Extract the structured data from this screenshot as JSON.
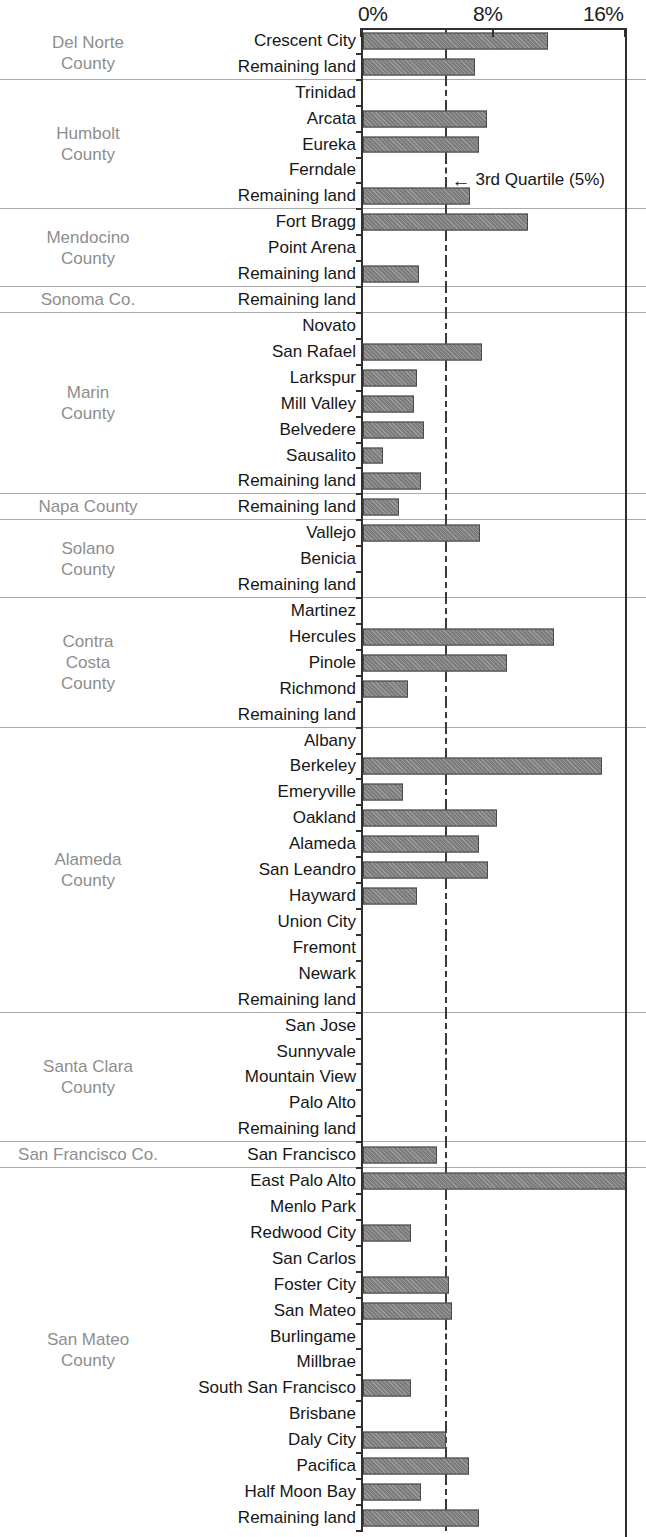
{
  "axis": {
    "ticks": [
      {
        "label": "0%",
        "value": 0
      },
      {
        "label": "8%",
        "value": 8
      },
      {
        "label": "16%",
        "value": 16
      }
    ],
    "min": 0,
    "max": 16,
    "unit": "%"
  },
  "annotation": {
    "arrow": "←",
    "text": "3rd Quartile (5%)",
    "value": 5
  },
  "quartile_line": {
    "value": 5,
    "style": "dashed"
  },
  "colors": {
    "bar_fill": "#7d7d7d",
    "bar_border": "#4a4a4a",
    "axis": "#303030",
    "county_label": "#8e8e8e",
    "row_label": "#161616",
    "separator": "#a9a9a9"
  },
  "chart_data": {
    "type": "bar",
    "orientation": "horizontal",
    "title": "",
    "xlabel": "",
    "ylabel": "",
    "xlim": [
      0,
      16
    ],
    "xticks": [
      0,
      8,
      16
    ],
    "xtick_labels": [
      "0%",
      "8%",
      "16%"
    ],
    "grid": false,
    "legend": null,
    "annotations": [
      {
        "text": "3rd Quartile (5%)",
        "x": 5,
        "category": "Ferndale",
        "marker": "left-arrow"
      }
    ],
    "reference_lines": [
      {
        "label": "3rd Quartile",
        "value": 5,
        "style": "dashed"
      }
    ],
    "groups": [
      {
        "county": "Del Norte\nCounty",
        "county_lines": [
          "Del Norte",
          "County"
        ],
        "categories": [
          "Crescent City",
          "Remaining land"
        ],
        "values": [
          11.2,
          6.8
        ]
      },
      {
        "county": "Humbolt County",
        "county_lines": [
          "Humbolt",
          "County"
        ],
        "categories": [
          "Trinidad",
          "Arcata",
          "Eureka",
          "Ferndale",
          "Remaining land"
        ],
        "values": [
          0,
          7.5,
          7.0,
          0,
          6.5
        ]
      },
      {
        "county": "Mendocino County",
        "county_lines": [
          "Mendocino",
          "County"
        ],
        "categories": [
          "Fort Bragg",
          "Point Arena",
          "Remaining land"
        ],
        "values": [
          10.0,
          0,
          3.4
        ]
      },
      {
        "county": "Sonoma Co.",
        "county_lines": [
          "Sonoma Co."
        ],
        "categories": [
          "Remaining land"
        ],
        "values": [
          0
        ]
      },
      {
        "county": "Marin County",
        "county_lines": [
          "Marin",
          "County"
        ],
        "categories": [
          "Novato",
          "San Rafael",
          "Larkspur",
          "Mill Valley",
          "Belvedere",
          "Sausalito",
          "Remaining land"
        ],
        "values": [
          0,
          7.2,
          3.3,
          3.1,
          3.7,
          1.2,
          3.5
        ]
      },
      {
        "county": "Napa County",
        "county_lines": [
          "Napa County"
        ],
        "categories": [
          "Remaining land"
        ],
        "values": [
          2.2
        ]
      },
      {
        "county": "Solano County",
        "county_lines": [
          "Solano",
          "County"
        ],
        "categories": [
          "Vallejo",
          "Benicia",
          "Remaining land"
        ],
        "values": [
          7.1,
          0,
          0
        ]
      },
      {
        "county": "Contra Costa County",
        "county_lines": [
          "Contra",
          "Costa",
          "County"
        ],
        "categories": [
          "Martinez",
          "Hercules",
          "Pinole",
          "Richmond",
          "Remaining land"
        ],
        "values": [
          0,
          11.6,
          8.7,
          2.7,
          0
        ]
      },
      {
        "county": "Alameda County",
        "county_lines": [
          "Alameda",
          "County"
        ],
        "categories": [
          "Albany",
          "Berkeley",
          "Emeryville",
          "Oakland",
          "Alameda",
          "San Leandro",
          "Hayward",
          "Union City",
          "Fremont",
          "Newark",
          "Remaining land"
        ],
        "values": [
          0,
          14.5,
          2.4,
          8.1,
          7.0,
          7.6,
          3.3,
          0,
          0,
          0,
          0
        ]
      },
      {
        "county": "Santa Clara County",
        "county_lines": [
          "Santa Clara",
          "County"
        ],
        "categories": [
          "San Jose",
          "Sunnyvale",
          "Mountain View",
          "Palo Alto",
          "Remaining land"
        ],
        "values": [
          0,
          0,
          0,
          0,
          0
        ]
      },
      {
        "county": "San Francisco Co.",
        "county_lines": [
          "San Francisco Co."
        ],
        "categories": [
          "San Francisco"
        ],
        "values": [
          4.5
        ]
      },
      {
        "county": "San Mateo County",
        "county_lines": [
          "San Mateo",
          "County"
        ],
        "categories": [
          "East Palo Alto",
          "Menlo Park",
          "Redwood City",
          "San Carlos",
          "Foster City",
          "San Mateo",
          "Burlingame",
          "Millbrae",
          "South San Francisco",
          "Brisbane",
          "Daly City",
          "Pacifica",
          "Half Moon Bay",
          "Remaining land"
        ],
        "values": [
          16.0,
          0,
          2.9,
          0,
          5.2,
          5.4,
          0,
          0,
          2.9,
          0,
          5.0,
          6.4,
          3.5,
          7.0
        ]
      }
    ]
  }
}
